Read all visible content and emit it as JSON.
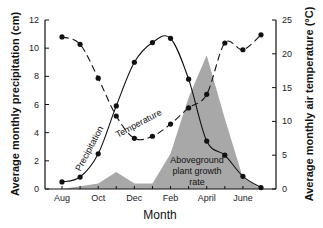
{
  "chart_data": {
    "type": "line",
    "title": "",
    "xlabel": "Month",
    "ylabel": "Average monthly precipitation (cm)",
    "ylabel_right": "Average monthly air temperature (°C)",
    "x": [
      "Aug",
      "Sep",
      "Oct",
      "Nov",
      "Dec",
      "Jan",
      "Feb",
      "Mar",
      "Apr",
      "May",
      "Jun",
      "Jul"
    ],
    "x_tick_labels": [
      "Aug",
      "Oct",
      "Dec",
      "Feb",
      "April",
      "June"
    ],
    "ylim": [
      0,
      12
    ],
    "ylim_right": [
      0,
      25
    ],
    "y_ticks": [
      0,
      2,
      4,
      6,
      8,
      10,
      12
    ],
    "y_ticks_right": [
      0,
      5,
      10,
      15,
      20,
      25
    ],
    "grid": false,
    "series": [
      {
        "name": "Precipitation",
        "axis": "left",
        "style": "solid line with dots",
        "values": [
          0.5,
          0.85,
          2.5,
          5.9,
          9.0,
          10.4,
          10.7,
          7.8,
          3.4,
          2.4,
          0.9,
          0.1
        ]
      },
      {
        "name": "Temperature",
        "axis": "right",
        "style": "dashed line with dots",
        "values": [
          22.5,
          21.4,
          16.4,
          10.8,
          7.5,
          7.8,
          9.6,
          12.0,
          14.0,
          21.6,
          20.6,
          22.8
        ]
      },
      {
        "name": "Aboveground plant growth rate",
        "axis": "left (relative)",
        "style": "gray filled area",
        "values": [
          0,
          0.2,
          0.4,
          1.2,
          0.4,
          0.4,
          2.5,
          6.5,
          9.5,
          5.0,
          0.8,
          0
        ]
      }
    ],
    "annotations": [
      "Precipitation",
      "Temperature",
      "Aboveground plant growth rate"
    ]
  },
  "labels": {
    "xaxis_title": "Month",
    "yaxis_left_title": "Average monthly precipitation (cm)",
    "yaxis_right_title": "Average monthly air temperature (°C)",
    "annot_precip": "Precipitation",
    "annot_temp": "Temperature",
    "annot_growth_1": "Aboveground",
    "annot_growth_2": "plant growth",
    "annot_growth_3": "rate"
  },
  "colors": {
    "area": "#a8a8a8",
    "line": "#111111"
  }
}
